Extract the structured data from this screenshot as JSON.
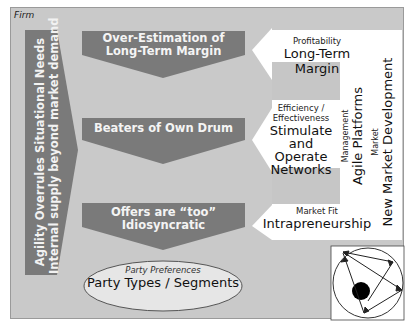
{
  "frame": {
    "label": "Firm"
  },
  "left_arrow": {
    "line1": "Agility Overrules Situational Needs",
    "line2": "Internal supply beyond market demand"
  },
  "chevrons": [
    {
      "label": "Over-Estimation of Long-Term Margin",
      "line1": "Over-Estimation of",
      "line2": "Long-Term Margin"
    },
    {
      "label": "Beaters of Own Drum",
      "line1": "Beaters of Own Drum"
    },
    {
      "label": "Offers are “too” Idiosyncratic",
      "line1": "Offers are “too”",
      "line2": "Idiosyncratic"
    }
  ],
  "right_arrows": [
    {
      "small": "Profitability",
      "big": "Long-Term Margin"
    },
    {
      "small1": "Efficiency /",
      "small2": "Effectiveness",
      "big1": "Stimulate and",
      "big2": "Operate",
      "big3": "Networks"
    },
    {
      "small": "Market Fit",
      "big": "Intrapreneurship"
    }
  ],
  "right_vertical": {
    "management_small": "Management",
    "management_big": "Agile Platforms",
    "market_small": "Market",
    "market_big": "New Market Development"
  },
  "ellipse": {
    "small": "Party Preferences",
    "big": "Party Types / Segments"
  },
  "colors": {
    "background": "#c9c9c9",
    "dark_shape": "#7a7a7a",
    "white_shape": "#ffffff",
    "light_box": "#c4c4c4"
  }
}
